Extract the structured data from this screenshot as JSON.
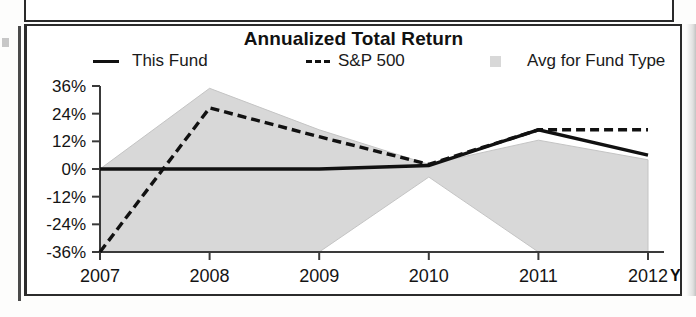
{
  "chart": {
    "title": "Annualized Total Return",
    "ytd_note": "YTD"
  },
  "legend": {
    "items": [
      {
        "label": "This Fund",
        "marker": "solid-line",
        "color": "#111111"
      },
      {
        "label": "S&P 500",
        "marker": "dashed-line",
        "color": "#111111"
      },
      {
        "label": "Avg for Fund Type",
        "marker": "gray-swatch",
        "color": "#d8d8d8"
      }
    ]
  },
  "chart_data": {
    "type": "line",
    "title": "Annualized Total Return",
    "xlabel": "",
    "ylabel": "",
    "x": [
      "2007",
      "2008",
      "2009",
      "2010",
      "2011",
      "2012"
    ],
    "xtick_labels": [
      "2007",
      "2008",
      "2009",
      "2010",
      "2011",
      "2012"
    ],
    "ytick_labels": [
      "36%",
      "24%",
      "12%",
      "0%",
      "-12%",
      "-24%",
      "-36%"
    ],
    "ytick_values": [
      36,
      24,
      12,
      0,
      -12,
      -24,
      -36
    ],
    "ylim": [
      -36,
      36
    ],
    "grid": false,
    "legend_position": "top",
    "series": [
      {
        "name": "This Fund",
        "style": "solid",
        "color": "#111111",
        "values": [
          0,
          0,
          0,
          1.5,
          17,
          6
        ]
      },
      {
        "name": "S&P 500",
        "style": "dashed",
        "color": "#111111",
        "values": [
          -36,
          26.5,
          14,
          2,
          17,
          17
        ]
      },
      {
        "name": "Avg for Fund Type",
        "style": "band",
        "color": "#d8d8d8",
        "upper": [
          0,
          35,
          17,
          2,
          12.5,
          4
        ],
        "lower": [
          -36,
          -36,
          -36,
          -3.5,
          -36,
          -36
        ]
      }
    ],
    "annotations": [
      "YTD"
    ]
  }
}
